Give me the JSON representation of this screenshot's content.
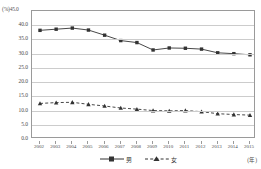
{
  "chart_data": {
    "type": "line",
    "title": "",
    "xlabel": "(年)",
    "ylabel": "(%)",
    "ylim": [
      0.0,
      45.0
    ],
    "yticks": [
      "45.0",
      "40.0",
      "35.0",
      "30.0",
      "25.0",
      "20.0",
      "15.0",
      "10.0",
      "5.0",
      "0.0"
    ],
    "ytick_values": [
      45.0,
      40.0,
      35.0,
      30.0,
      25.0,
      20.0,
      15.0,
      10.0,
      5.0,
      0.0
    ],
    "grid": true,
    "legend_position": "bottom",
    "categories": [
      "2002",
      "2003",
      "2004",
      "2005",
      "2006",
      "2007",
      "2008",
      "2009",
      "2010",
      "2011",
      "2012",
      "2013",
      "2014",
      "2015"
    ],
    "series": [
      {
        "name": "男",
        "style": "solid",
        "marker": "square",
        "color": "#333333",
        "values": [
          38.2,
          38.6,
          39.0,
          38.3,
          36.5,
          34.6,
          33.9,
          31.3,
          32.0,
          31.9,
          31.6,
          30.3,
          30.0,
          29.6
        ]
      },
      {
        "name": "女",
        "style": "dashed",
        "marker": "triangle",
        "color": "#333333",
        "values": [
          12.5,
          12.8,
          12.9,
          12.2,
          11.6,
          10.9,
          10.5,
          10.0,
          9.9,
          10.0,
          9.6,
          8.9,
          8.6,
          8.4
        ]
      }
    ]
  },
  "legend": {
    "items": [
      {
        "label": "男",
        "icon": "solid-line-square-marker"
      },
      {
        "label": "女",
        "icon": "dashed-line-triangle-marker"
      }
    ]
  },
  "axis": {
    "y_unit": "(%)",
    "y_top_label": "45.0",
    "x_unit": "(年)"
  }
}
